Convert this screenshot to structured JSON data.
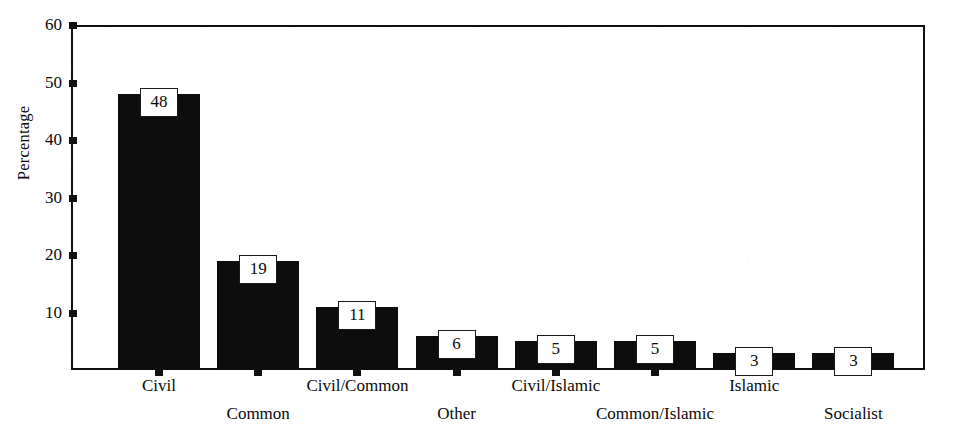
{
  "chart_data": {
    "type": "bar",
    "title": "",
    "subtitle": "",
    "xlabel": "",
    "ylabel": "Percentage",
    "categories": [
      "Civil",
      "Common",
      "Civil/Common",
      "Other",
      "Civil/Islamic",
      "Common/Islamic",
      "Islamic",
      "Socialist"
    ],
    "values": [
      48,
      19,
      11,
      6,
      5,
      5,
      3,
      3
    ],
    "data_labels": [
      "48",
      "19",
      "11",
      "6",
      "5",
      "5",
      "3",
      "3"
    ],
    "ylim": [
      0,
      60
    ],
    "ytick_labels": [
      "60",
      "50",
      "40",
      "30",
      "20",
      "10"
    ],
    "ytick_values": [
      60,
      50,
      40,
      30,
      20,
      10
    ],
    "grid": false,
    "legend": false,
    "legend_position": "none",
    "bar_color": "#0d0d0d",
    "label_box_fill": "#ffffff",
    "label_box_border": "#1a1a1a",
    "axis_color": "#111111",
    "background_color": "#ffffff",
    "category_label_rows": "staggered-two-row",
    "annotations": []
  }
}
